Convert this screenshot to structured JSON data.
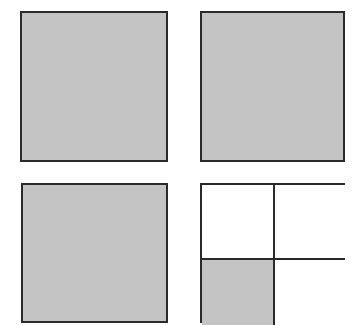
{
  "diagram": {
    "colors": {
      "shade": "#c4c4c4",
      "border": "#2a2a2a",
      "background": "#ffffff"
    },
    "squares": [
      {
        "id": "top-left",
        "shaded": true,
        "divisions": 1,
        "shaded_parts": 1
      },
      {
        "id": "top-right",
        "shaded": true,
        "divisions": 1,
        "shaded_parts": 1
      },
      {
        "id": "bottom-left",
        "shaded": true,
        "divisions": 1,
        "shaded_parts": 1
      },
      {
        "id": "bottom-right",
        "shaded": false,
        "divisions": 4,
        "shaded_parts": 1,
        "shaded_cell": "bottom-left"
      }
    ]
  }
}
